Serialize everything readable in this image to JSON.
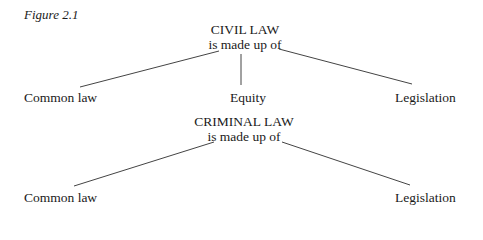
{
  "figure_label": "Figure 2.1",
  "diagrams": [
    {
      "root": "CIVIL LAW",
      "connector": "is made up of",
      "children": [
        "Common law",
        "Equity",
        "Legislation"
      ]
    },
    {
      "root": "CRIMINAL LAW",
      "connector": "is made up of",
      "children": [
        "Common law",
        "Legislation"
      ]
    }
  ]
}
